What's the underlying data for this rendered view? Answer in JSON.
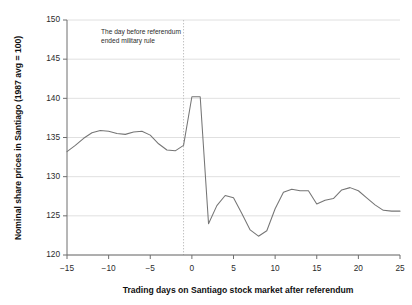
{
  "chart_data": {
    "type": "line",
    "title": "",
    "xlabel": "Trading days on Santiago stock market after referendum",
    "ylabel": "Nominal share prices in Santiago (1987 avg = 100)",
    "xlim": [
      -15,
      25
    ],
    "ylim": [
      120,
      150
    ],
    "xticks": [
      -15,
      -10,
      -5,
      0,
      5,
      10,
      15,
      20,
      25
    ],
    "xticklabels": [
      "−15",
      "−10",
      "−5",
      "0",
      "5",
      "10",
      "15",
      "20",
      "25"
    ],
    "yticks": [
      120,
      125,
      130,
      135,
      140,
      145,
      150
    ],
    "yticklabels": [
      "120",
      "125",
      "130",
      "135",
      "140",
      "145",
      "150"
    ],
    "grid": "horizontal",
    "legend": "none",
    "annotations": [
      {
        "name": "referendum-note",
        "text_line_1": "The day before referendum",
        "text_line_2": "ended military rule",
        "x": -5.2,
        "y": 147.6
      }
    ],
    "event_marker": {
      "name": "referendum-day-line",
      "x": -1,
      "style": "dotted-vertical"
    },
    "series": [
      {
        "name": "Nominal share prices in Santiago",
        "color": "#757575",
        "x": [
          -15,
          -14,
          -13,
          -12,
          -11,
          -10,
          -9,
          -8,
          -7,
          -6,
          -5,
          -4,
          -3,
          -2,
          -1,
          0,
          1,
          2,
          3,
          4,
          5,
          6,
          7,
          8,
          9,
          10,
          11,
          12,
          13,
          14,
          15,
          16,
          17,
          18,
          19,
          20,
          21,
          22,
          23,
          24,
          25
        ],
        "values": [
          133.2,
          134.0,
          134.9,
          135.6,
          135.9,
          135.8,
          135.5,
          135.4,
          135.7,
          135.8,
          135.3,
          134.2,
          133.4,
          133.3,
          134.0,
          140.2,
          140.2,
          124.0,
          126.3,
          127.6,
          127.3,
          125.3,
          123.2,
          122.4,
          123.1,
          125.9,
          128.0,
          128.4,
          128.2,
          128.2,
          126.5,
          127.0,
          127.2,
          128.3,
          128.6,
          128.2,
          127.3,
          126.4,
          125.7,
          125.6,
          125.6
        ]
      }
    ],
    "series_tail": {
      "note": "values continue to day 25",
      "x": [
        21,
        22,
        23,
        24,
        25
      ],
      "values": [
        125.6,
        126.1,
        126.8,
        127.2,
        127.4
      ]
    }
  },
  "plot_geometry": {
    "left": 67,
    "right": 400,
    "top": 20,
    "bottom": 255
  }
}
